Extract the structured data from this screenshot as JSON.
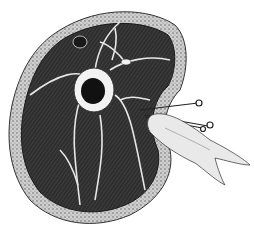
{
  "image": {
    "description": "Black-and-white anatomical engraving of a limb cross-section showing a central bone with marrow, surrounding dark muscle tissue divided by pale fascial septa, an outer skin/fat layer, and a gloved hand holding pins at the right side",
    "colors": {
      "background": "#ffffff",
      "skin_layer": "#b8b8b8",
      "muscle": "#2e2e2e",
      "septa": "#e6e6e6",
      "bone": "#f2f2f2",
      "marrow": "#111111",
      "hand": "#e9e9e9"
    }
  }
}
